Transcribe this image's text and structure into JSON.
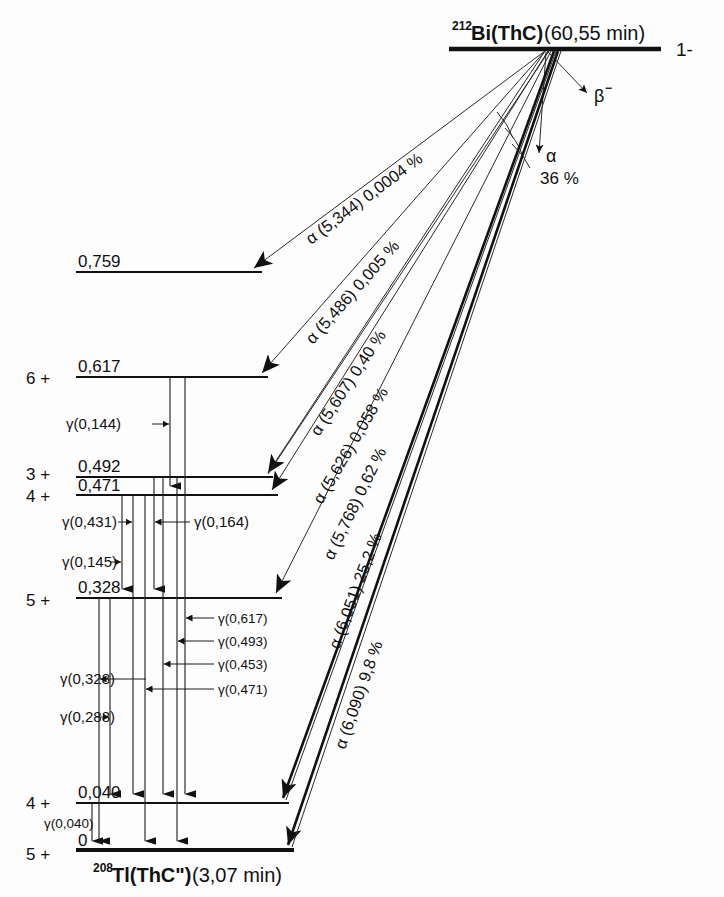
{
  "diagram": {
    "title_parent_mass": "212",
    "title_parent": "Bi(ThC)",
    "title_parent_halflife": "(60,55 min)",
    "parent_spin": "1-",
    "title_daughter_mass": "208",
    "title_daughter": "Tl(ThC\")",
    "title_daughter_halflife": "(3,07 min)",
    "beta_label": "β",
    "beta_sup": "−",
    "alpha_branch_label": "α",
    "alpha_branch_pct": "36 %"
  },
  "levels": [
    {
      "energy": "0,759",
      "spin": ""
    },
    {
      "energy": "0,617",
      "spin": "6 +"
    },
    {
      "energy": "0,492",
      "spin": "3 +"
    },
    {
      "energy": "0,471",
      "spin": "4 +"
    },
    {
      "energy": "0,328",
      "spin": "5 +"
    },
    {
      "energy": "0,040",
      "spin": "4 +"
    },
    {
      "energy": "0",
      "spin": "5 +"
    }
  ],
  "alpha_transitions": [
    {
      "label": "α (5,344) 0,0004 %",
      "energy": "5,344",
      "intensity": "0,0004 %"
    },
    {
      "label": "α (5,486) 0,005 %",
      "energy": "5,486",
      "intensity": "0,005 %"
    },
    {
      "label": "α (5,607) 0,40 %",
      "energy": "5,607",
      "intensity": "0,40 %"
    },
    {
      "label": "α (5,626) 0,058 %",
      "energy": "5,626",
      "intensity": "0,058 %"
    },
    {
      "label": "α (5,768) 0,62 %",
      "energy": "5,768",
      "intensity": "0,62 %"
    },
    {
      "label": "α (6,051) 25,2 %",
      "energy": "6,051",
      "intensity": "25,2 %"
    },
    {
      "label": "α (6,090) 9,8 %",
      "energy": "6,090",
      "intensity": "9,8 %"
    }
  ],
  "gamma_transitions": [
    {
      "label": "γ(0,144)",
      "energy": "0,144"
    },
    {
      "label": "γ(0,431)",
      "energy": "0,431"
    },
    {
      "label": "γ(0,164)",
      "energy": "0,164"
    },
    {
      "label": "γ(0,145)",
      "energy": "0,145"
    },
    {
      "label": "γ(0,617)",
      "energy": "0,617"
    },
    {
      "label": "γ(0,493)",
      "energy": "0,493"
    },
    {
      "label": "γ(0,453)",
      "energy": "0,453"
    },
    {
      "label": "γ(0,471)",
      "energy": "0,471"
    },
    {
      "label": "γ(0,328)",
      "energy": "0,328"
    },
    {
      "label": "γ(0,288)",
      "energy": "0,288"
    },
    {
      "label": "γ(0,040)",
      "energy": "0,040"
    }
  ],
  "colors": {
    "ink": "#111111",
    "background": "#fdfdfd"
  }
}
